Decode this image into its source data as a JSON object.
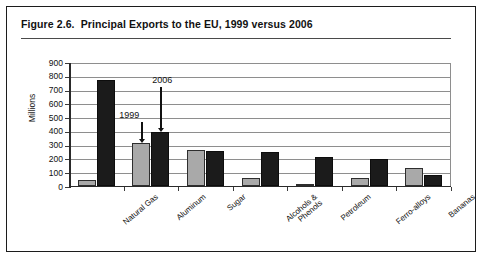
{
  "figure": {
    "title": "Figure 2.6.  Principal Exports to the EU, 1999 versus 2006"
  },
  "chart_data": {
    "type": "bar",
    "title": "Principal Exports to the EU, 1999 versus 2006",
    "xlabel": "",
    "ylabel": "Millions",
    "ylim": [
      0,
      900
    ],
    "ytick_values": [
      0,
      100,
      200,
      300,
      400,
      500,
      600,
      700,
      800,
      900
    ],
    "ytick_labels": [
      "0",
      "100",
      "200",
      "300",
      "400",
      "500",
      "600",
      "700",
      "800",
      "900"
    ],
    "grid": true,
    "legend": "none",
    "categories": [
      "Natural Gas",
      "Aluminum",
      "Sugar",
      "Alcohols &\nPhenols",
      "Petroleum",
      "Ferro-alloys",
      "Bananas"
    ],
    "series": [
      {
        "name": "1999",
        "color": "#a9a9a9",
        "values": [
          40,
          310,
          258,
          55,
          5,
          55,
          130
        ]
      },
      {
        "name": "2006",
        "color": "#1b1b1b",
        "values": [
          765,
          390,
          250,
          240,
          205,
          195,
          75
        ]
      }
    ],
    "annotations": [
      {
        "text": "1999",
        "points_to_series": "1999",
        "points_to_category": "Aluminum"
      },
      {
        "text": "2006",
        "points_to_series": "2006",
        "points_to_category": "Aluminum"
      }
    ]
  }
}
